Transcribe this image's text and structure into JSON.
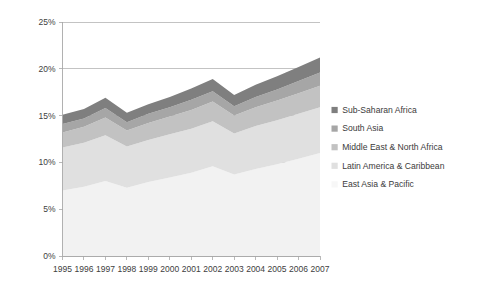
{
  "chart_data": {
    "type": "area",
    "stacked": true,
    "title": "",
    "subtitle": "",
    "xlabel": "",
    "ylabel": "",
    "categories": [
      "1995",
      "1996",
      "1997",
      "1998",
      "1999",
      "2000",
      "2001",
      "2002",
      "2003",
      "2004",
      "2005",
      "2006",
      "2007"
    ],
    "x_tick_labels": [
      "1995",
      "1996",
      "1997",
      "1998",
      "1999",
      "2000",
      "2001",
      "2002",
      "2003",
      "2004",
      "2005",
      "2006",
      "2007"
    ],
    "y_tick_labels": [
      "0%",
      "5%",
      "10%",
      "15%",
      "20%",
      "25%"
    ],
    "y_tick_values": [
      0,
      5,
      10,
      15,
      20,
      25
    ],
    "ylim": [
      0,
      25
    ],
    "y_unit": "%",
    "grid": true,
    "grid_axis": "y",
    "legend_position": "right",
    "series": [
      {
        "name": "East Asia & Pacific",
        "color": "#f2f2f2",
        "values": [
          7.0,
          7.4,
          8.0,
          7.3,
          7.9,
          8.4,
          8.9,
          9.6,
          8.7,
          9.3,
          9.8,
          10.4,
          11.0
        ]
      },
      {
        "name": "Latin America & Caribbean",
        "color": "#e0e0e0",
        "values": [
          4.6,
          4.7,
          4.9,
          4.4,
          4.5,
          4.6,
          4.7,
          4.8,
          4.4,
          4.6,
          4.7,
          4.8,
          4.9
        ]
      },
      {
        "name": "Middle East & North Africa",
        "color": "#c2c2c2",
        "values": [
          1.6,
          1.7,
          1.9,
          1.7,
          1.8,
          1.9,
          2.0,
          2.1,
          1.9,
          2.0,
          2.1,
          2.2,
          2.3
        ]
      },
      {
        "name": "South Asia",
        "color": "#a6a6a6",
        "values": [
          0.9,
          0.9,
          1.0,
          0.9,
          1.0,
          1.0,
          1.1,
          1.1,
          1.0,
          1.1,
          1.2,
          1.3,
          1.4
        ]
      },
      {
        "name": "Sub-Saharan Africa",
        "color": "#7f7f7f",
        "values": [
          1.0,
          1.0,
          1.1,
          1.0,
          1.0,
          1.1,
          1.2,
          1.3,
          1.2,
          1.3,
          1.4,
          1.5,
          1.6
        ]
      }
    ],
    "stack_totals": [
      15.1,
      15.7,
      16.9,
      15.3,
      16.2,
      17.0,
      17.9,
      18.9,
      17.2,
      18.3,
      19.2,
      20.2,
      21.2
    ]
  },
  "legend": {
    "entries": [
      {
        "label": "Sub-Saharan Africa",
        "color": "#7f7f7f"
      },
      {
        "label": "South Asia",
        "color": "#a6a6a6"
      },
      {
        "label": "Middle East & North Africa",
        "color": "#c2c2c2"
      },
      {
        "label": "Latin America & Caribbean",
        "color": "#e0e0e0"
      },
      {
        "label": "East Asia & Pacific",
        "color": "#f7f7f7"
      }
    ]
  },
  "axes": {
    "y_axis_name": "percent-axis",
    "x_axis_name": "year-axis"
  }
}
